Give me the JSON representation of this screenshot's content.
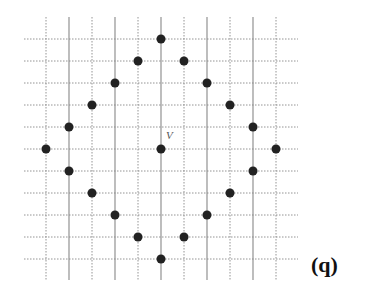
{
  "figure": {
    "label": "(q)",
    "center_label": "V",
    "grid": {
      "x_lines": [
        46,
        69,
        92,
        115,
        138,
        161,
        184,
        207,
        230,
        253,
        276
      ],
      "y_lines": [
        39,
        61,
        83,
        105,
        127,
        149,
        171,
        193,
        215,
        237,
        259
      ],
      "solid_x": [
        69,
        115,
        161,
        207,
        253
      ],
      "x_extent": [
        24,
        298
      ],
      "y_extent": [
        17,
        280
      ],
      "line_color": "#888888"
    },
    "center_point": {
      "x": 161,
      "y": 149
    },
    "dots": [
      {
        "x": 161,
        "y": 39
      },
      {
        "x": 138,
        "y": 61
      },
      {
        "x": 184,
        "y": 61
      },
      {
        "x": 115,
        "y": 83
      },
      {
        "x": 207,
        "y": 83
      },
      {
        "x": 92,
        "y": 105
      },
      {
        "x": 230,
        "y": 105
      },
      {
        "x": 69,
        "y": 127
      },
      {
        "x": 253,
        "y": 127
      },
      {
        "x": 46,
        "y": 149
      },
      {
        "x": 161,
        "y": 149
      },
      {
        "x": 276,
        "y": 149
      },
      {
        "x": 69,
        "y": 171
      },
      {
        "x": 253,
        "y": 171
      },
      {
        "x": 92,
        "y": 193
      },
      {
        "x": 230,
        "y": 193
      },
      {
        "x": 115,
        "y": 215
      },
      {
        "x": 207,
        "y": 215
      },
      {
        "x": 138,
        "y": 237
      },
      {
        "x": 184,
        "y": 237
      },
      {
        "x": 161,
        "y": 259
      }
    ],
    "dot_color": "#222222",
    "dot_radius": 4.5
  }
}
